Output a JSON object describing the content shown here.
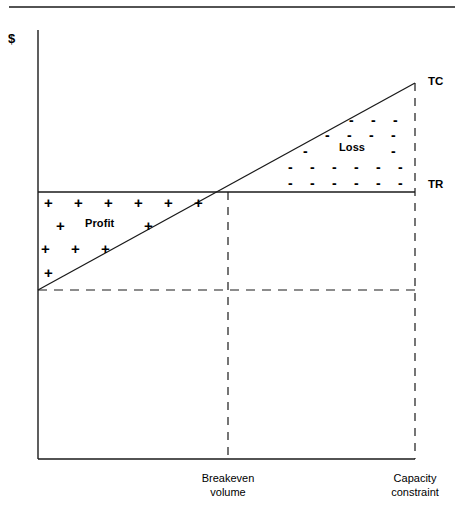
{
  "figure": {
    "type": "breakeven-chart",
    "top_rule": true,
    "axis": {
      "y_label": "$",
      "x_axis_label": "",
      "origin": {
        "x": 38,
        "y": 459
      },
      "y_axis_top": 30,
      "x_axis_right": 415
    },
    "labels": {
      "tc": "TC",
      "tr": "TR",
      "profit": "Profit",
      "loss": "Loss",
      "breakeven": "Breakeven\nvolume",
      "capacity": "Capacity\nconstraint"
    },
    "symbols": {
      "plus": "+",
      "minus": "-"
    }
  },
  "chart_data": {
    "type": "line",
    "title": "",
    "subtitle": "",
    "xlabel": "",
    "ylabel": "$",
    "xlim": [
      0,
      415
    ],
    "ylim": [
      0,
      459
    ],
    "grid": false,
    "legend": "inline-end-labels",
    "annotations": [
      {
        "name": "profit-region",
        "text": "Profit",
        "symbol": "+",
        "x": 130,
        "y": 240
      },
      {
        "name": "loss-region",
        "text": "Loss",
        "symbol": "-",
        "x": 350,
        "y": 145
      },
      {
        "name": "breakeven-marker",
        "text": "Breakeven volume",
        "x": 228,
        "y": 459
      },
      {
        "name": "capacity-marker",
        "text": "Capacity constraint",
        "x": 415,
        "y": 459
      }
    ],
    "series": [
      {
        "name": "TC",
        "label": "TC",
        "description": "Total cost line rising from fixed cost at zero volume to maximum at capacity constraint",
        "x": [
          38,
          415
        ],
        "y": [
          290,
          83
        ],
        "style": "solid"
      },
      {
        "name": "TR",
        "label": "TR",
        "description": "Total revenue line, drawn horizontally across the plot at the breakeven revenue level",
        "x": [
          38,
          415
        ],
        "y": [
          192,
          192
        ],
        "style": "solid"
      },
      {
        "name": "FixedCost",
        "label": "",
        "description": "Fixed cost reference level shown as a horizontal dashed line",
        "x": [
          38,
          415
        ],
        "y": [
          290,
          290
        ],
        "style": "dashed"
      }
    ],
    "markers": [
      {
        "name": "breakeven-point",
        "x": 228,
        "y": 192,
        "label": "Breakeven volume"
      },
      {
        "name": "capacity-point",
        "x": 415,
        "y": 459,
        "label": "Capacity constraint"
      }
    ],
    "verticals": [
      {
        "name": "breakeven-vertical",
        "x": 228,
        "y_from": 192,
        "y_to": 459,
        "style": "dashed"
      },
      {
        "name": "capacity-vertical",
        "x": 415,
        "y_from": 83,
        "y_to": 459,
        "style": "dashed"
      }
    ]
  },
  "plus_marks": [
    {
      "x": 44,
      "y": 195
    },
    {
      "x": 74,
      "y": 195
    },
    {
      "x": 104,
      "y": 195
    },
    {
      "x": 134,
      "y": 195
    },
    {
      "x": 164,
      "y": 195
    },
    {
      "x": 194,
      "y": 195
    },
    {
      "x": 56,
      "y": 218
    },
    {
      "x": 144,
      "y": 218
    },
    {
      "x": 41,
      "y": 241
    },
    {
      "x": 71,
      "y": 241
    },
    {
      "x": 101,
      "y": 241
    },
    {
      "x": 44,
      "y": 265
    }
  ],
  "minus_marks": [
    {
      "x": 349,
      "y": 113
    },
    {
      "x": 371,
      "y": 113
    },
    {
      "x": 393,
      "y": 113
    },
    {
      "x": 325,
      "y": 128
    },
    {
      "x": 347,
      "y": 128
    },
    {
      "x": 369,
      "y": 128
    },
    {
      "x": 391,
      "y": 128
    },
    {
      "x": 303,
      "y": 144
    },
    {
      "x": 391,
      "y": 144
    },
    {
      "x": 288,
      "y": 160
    },
    {
      "x": 310,
      "y": 160
    },
    {
      "x": 332,
      "y": 160
    },
    {
      "x": 354,
      "y": 160
    },
    {
      "x": 376,
      "y": 160
    },
    {
      "x": 398,
      "y": 160
    },
    {
      "x": 288,
      "y": 176
    },
    {
      "x": 310,
      "y": 176
    },
    {
      "x": 332,
      "y": 176
    },
    {
      "x": 354,
      "y": 176
    },
    {
      "x": 376,
      "y": 176
    },
    {
      "x": 398,
      "y": 176
    }
  ]
}
